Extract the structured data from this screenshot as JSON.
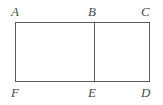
{
  "figure": {
    "type": "geometry-diagram",
    "canvas": {
      "width": 163,
      "height": 105,
      "background_color": "#ffffff"
    },
    "style": {
      "line_color": "#5a5a5a",
      "line_width": 1,
      "label_color": "#4a4a4a",
      "label_font_style": "italic-serif",
      "label_font_size": 13
    },
    "rectangle": {
      "left": 15,
      "top": 22,
      "right": 150,
      "bottom": 82
    },
    "divider": {
      "orientation": "vertical",
      "x": 94,
      "y_top": 22,
      "y_bottom": 82
    },
    "vertices": [
      {
        "label": "A",
        "position": "top-left",
        "x": 15,
        "y": 22
      },
      {
        "label": "B",
        "position": "top-middle",
        "x": 94,
        "y": 22
      },
      {
        "label": "C",
        "position": "top-right",
        "x": 150,
        "y": 22
      },
      {
        "label": "F",
        "position": "bottom-left",
        "x": 15,
        "y": 82
      },
      {
        "label": "E",
        "position": "bottom-middle",
        "x": 94,
        "y": 82
      },
      {
        "label": "D",
        "position": "bottom-right",
        "x": 150,
        "y": 82
      }
    ]
  }
}
